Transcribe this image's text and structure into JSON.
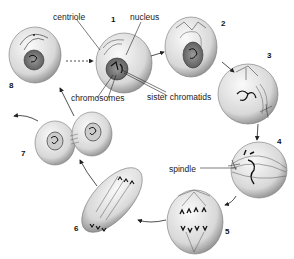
{
  "diagram": {
    "type": "cell-cycle-mitosis",
    "stages": [
      {
        "number": "1",
        "x": 111,
        "y": 16
      },
      {
        "number": "2",
        "x": 221,
        "y": 20
      },
      {
        "number": "3",
        "x": 267,
        "y": 52
      },
      {
        "number": "4",
        "x": 277,
        "y": 138
      },
      {
        "number": "5",
        "x": 225,
        "y": 228
      },
      {
        "number": "6",
        "x": 74,
        "y": 225
      },
      {
        "number": "7",
        "x": 21,
        "y": 150
      },
      {
        "number": "8",
        "x": 9,
        "y": 82
      }
    ],
    "labels": {
      "centriole": "centriole",
      "nucleus": "nucleus",
      "chromosomes": "chromosomes",
      "sister_chromatids": "sister chromatids",
      "spindle": "spindle"
    }
  }
}
